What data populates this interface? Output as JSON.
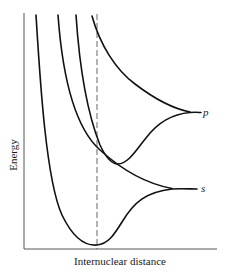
{
  "diagram": {
    "type": "potential-energy-curves",
    "y_axis_label": "Energy",
    "x_axis_label": "Internuclear distance",
    "asymptote_labels": {
      "upper": "p",
      "lower": "s"
    },
    "curves": [
      {
        "name": "s-bonding",
        "asymptote": "s",
        "description": "deep well with minimum at dashed line"
      },
      {
        "name": "s-antibonding",
        "asymptote": "s",
        "description": "repulsive, descends to s limit"
      },
      {
        "name": "p-bonding",
        "asymptote": "p",
        "description": "shallow well, minimum right of dashed line"
      },
      {
        "name": "p-antibonding",
        "asymptote": "p",
        "description": "repulsive, descends to p limit"
      }
    ],
    "reference_line": "equilibrium internuclear distance (dashed)",
    "colors": {
      "curve": "#111111",
      "axis": "#555555",
      "background": "#ffffff"
    }
  }
}
